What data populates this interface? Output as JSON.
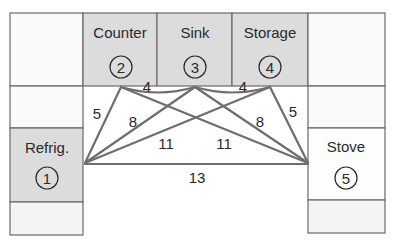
{
  "diagram": {
    "title_partial": "",
    "colors": {
      "shaded_cell": "#dcdcdc",
      "light_cell": "#f2f2f2",
      "blank_cell": "#fafafa",
      "line": "#6e6e6e",
      "border": "#6a6a6a"
    },
    "stations": [
      {
        "id": 1,
        "label": "Refrig.",
        "number": "1"
      },
      {
        "id": 2,
        "label": "Counter",
        "number": "2"
      },
      {
        "id": 3,
        "label": "Sink",
        "number": "3"
      },
      {
        "id": 4,
        "label": "Storage",
        "number": "4"
      },
      {
        "id": 5,
        "label": "Stove",
        "number": "5"
      }
    ],
    "distances": [
      {
        "from": 2,
        "to": 3,
        "value": "4"
      },
      {
        "from": 3,
        "to": 4,
        "value": "4"
      },
      {
        "from": 1,
        "to": 2,
        "value": "5"
      },
      {
        "from": 4,
        "to": 5,
        "value": "5"
      },
      {
        "from": 1,
        "to": 3,
        "value": "8"
      },
      {
        "from": 3,
        "to": 5,
        "value": "8"
      },
      {
        "from": 1,
        "to": 4,
        "value": "11"
      },
      {
        "from": 2,
        "to": 5,
        "value": "11"
      },
      {
        "from": 1,
        "to": 5,
        "value": "13"
      }
    ]
  }
}
